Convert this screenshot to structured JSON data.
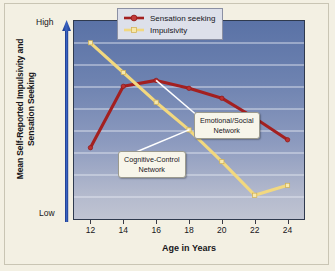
{
  "chart_data": {
    "type": "line",
    "title": "",
    "xlabel": "Age in Years",
    "ylabel": "Mean Self-Reported Impulsivity and Sensation Seeking",
    "x": [
      12,
      14,
      16,
      18,
      20,
      22,
      24
    ],
    "xlim": [
      11,
      25
    ],
    "ylim": [
      0,
      100
    ],
    "y_axis_endpoints": {
      "high": "High",
      "low": "Low"
    },
    "grid": true,
    "gridlines_count": 8,
    "legend_position": "top-right-inside",
    "series": [
      {
        "name": "Sensation seeking",
        "color": "#a32020",
        "marker": "circle",
        "values": [
          36,
          67,
          70,
          66,
          61,
          51,
          40
        ],
        "annotation": "Emotional/Social Network"
      },
      {
        "name": "Impulsivity",
        "color": "#f2d87f",
        "marker": "square",
        "values": [
          89,
          74,
          59,
          45,
          29,
          12,
          17
        ],
        "annotation": "Cognitive-Control Network"
      }
    ],
    "annotations": [
      {
        "label": "Emotional/Social Network",
        "line1": "Emotional/Social",
        "line2": "Network",
        "target_series": "Sensation seeking",
        "target_x": 16
      },
      {
        "label": "Cognitive-Control Network",
        "line1": "Cognitive-Control",
        "line2": "Network",
        "target_series": "Impulsivity",
        "target_x": 18
      }
    ],
    "tick_labels": [
      "12",
      "14",
      "16",
      "18",
      "20",
      "22",
      "24"
    ]
  },
  "axes": {
    "y_high": "High",
    "y_low": "Low",
    "y_title": "Mean Self-Reported Impulsivity and Sensation Seeking",
    "x_title": "Age in Years",
    "x_ticks": [
      "12",
      "14",
      "16",
      "18",
      "20",
      "22",
      "24"
    ]
  },
  "legend": {
    "items": [
      {
        "label": "Sensation seeking",
        "color": "#a32020"
      },
      {
        "label": "Impulsivity",
        "color": "#f2d87f"
      }
    ]
  },
  "callouts": {
    "emotional": {
      "line1": "Emotional/Social",
      "line2": "Network"
    },
    "cognitive": {
      "line1": "Cognitive-Control",
      "line2": "Network"
    }
  },
  "colors": {
    "sensation_seeking": "#a32020",
    "impulsivity": "#f2d87f",
    "plot_top": "#5a72a6",
    "plot_bottom": "#c0c4d2",
    "page_background": "#f3f0e3",
    "axis_arrow": "#2c4a92"
  }
}
